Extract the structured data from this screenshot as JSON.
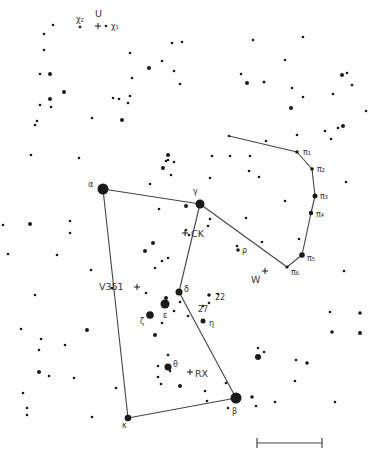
{
  "map": {
    "title": "Orion constellation finder chart",
    "colors": {
      "background": "#ffffff",
      "ink": "#1a1a1a",
      "label": "#333333",
      "line": "#444444"
    },
    "figure_lines": [
      {
        "name": "alpha-gamma",
        "from": [
          103,
          189
        ],
        "to": [
          200,
          204
        ]
      },
      {
        "name": "alpha-kappa",
        "from": [
          103,
          189
        ],
        "to": [
          128,
          418
        ]
      },
      {
        "name": "kappa-beta",
        "from": [
          128,
          418
        ],
        "to": [
          236,
          398
        ]
      },
      {
        "name": "beta-delta",
        "from": [
          236,
          398
        ],
        "to": [
          179,
          292
        ]
      },
      {
        "name": "delta-gamma",
        "from": [
          179,
          292
        ],
        "to": [
          200,
          204
        ]
      },
      {
        "name": "gamma-pi6",
        "from": [
          200,
          204
        ],
        "to": [
          287,
          267
        ]
      },
      {
        "name": "pi6-pi5",
        "from": [
          287,
          267
        ],
        "to": [
          302,
          255
        ]
      },
      {
        "name": "pi5-pi4",
        "from": [
          302,
          255
        ],
        "to": [
          311,
          213
        ]
      },
      {
        "name": "pi4-pi3",
        "from": [
          311,
          213
        ],
        "to": [
          315,
          196
        ]
      },
      {
        "name": "pi3-pi2",
        "from": [
          315,
          196
        ],
        "to": [
          312,
          169
        ]
      },
      {
        "name": "pi2-pi1",
        "from": [
          312,
          169
        ],
        "to": [
          297,
          152
        ]
      },
      {
        "name": "pi1-start",
        "from": [
          297,
          152
        ],
        "to": [
          229,
          136
        ]
      }
    ],
    "named_stars": [
      {
        "id": "alpha",
        "label": "α",
        "x": 103,
        "y": 189,
        "r": 5.5,
        "lx": 88,
        "ly": 187
      },
      {
        "id": "gamma",
        "label": "γ",
        "x": 200,
        "y": 204,
        "r": 4.5,
        "lx": 193,
        "ly": 194
      },
      {
        "id": "delta",
        "label": "δ",
        "x": 179,
        "y": 292,
        "r": 3.5,
        "lx": 184,
        "ly": 292
      },
      {
        "id": "epsilon",
        "label": "ε",
        "x": 165,
        "y": 304,
        "r": 4.5,
        "lx": 163,
        "ly": 318
      },
      {
        "id": "zeta",
        "label": "ζ",
        "x": 150,
        "y": 315,
        "r": 3.8,
        "lx": 140,
        "ly": 324
      },
      {
        "id": "eta",
        "label": "η",
        "x": 203,
        "y": 321,
        "r": 2.5,
        "lx": 209,
        "ly": 326
      },
      {
        "id": "kappa",
        "label": "κ",
        "x": 128,
        "y": 418,
        "r": 3.3,
        "lx": 122,
        "ly": 428
      },
      {
        "id": "beta",
        "label": "β",
        "x": 236,
        "y": 398,
        "r": 5.5,
        "lx": 232,
        "ly": 414
      },
      {
        "id": "theta",
        "label": "θ",
        "x": 168,
        "y": 367,
        "r": 3.5,
        "lx": 173,
        "ly": 367
      },
      {
        "id": "rho",
        "label": "ρ",
        "x": 238,
        "y": 250,
        "r": 1.8,
        "lx": 242,
        "ly": 253
      },
      {
        "id": "pi1",
        "label": "π₁",
        "x": 297,
        "y": 152,
        "r": 1.8,
        "lx": 303,
        "ly": 155
      },
      {
        "id": "pi2",
        "label": "π₂",
        "x": 312,
        "y": 169,
        "r": 1.8,
        "lx": 317,
        "ly": 172
      },
      {
        "id": "pi3",
        "label": "π₃",
        "x": 315,
        "y": 196,
        "r": 2.5,
        "lx": 320,
        "ly": 199
      },
      {
        "id": "pi4",
        "label": "π₄",
        "x": 311,
        "y": 213,
        "r": 2.2,
        "lx": 316,
        "ly": 217
      },
      {
        "id": "pi5",
        "label": "π₅",
        "x": 302,
        "y": 255,
        "r": 2.8,
        "lx": 307,
        "ly": 261
      },
      {
        "id": "pi6",
        "label": "π₆",
        "x": 287,
        "y": 267,
        "r": 1.6,
        "lx": 291,
        "ly": 275
      },
      {
        "id": "chi1",
        "label": "χ₁",
        "x": 106,
        "y": 26,
        "r": 1.3,
        "lx": 111,
        "ly": 29
      },
      {
        "id": "chi2",
        "label": "χ₂",
        "x": 80,
        "y": 27,
        "r": 1.3,
        "lx": 76,
        "ly": 22
      },
      {
        "id": "n22",
        "label": "22",
        "x": 209,
        "y": 295,
        "r": 1.8,
        "lx": 215,
        "ly": 300
      },
      {
        "id": "n27",
        "label": "27",
        "x": 203,
        "y": 306,
        "r": 1.2,
        "lx": 198,
        "ly": 312
      }
    ],
    "variable_stars": [
      {
        "id": "U",
        "label": "U",
        "x": 98,
        "y": 26,
        "lx": 95,
        "ly": 17
      },
      {
        "id": "CK",
        "label": "CK",
        "x": 185,
        "y": 233,
        "lx": 191,
        "ly": 237
      },
      {
        "id": "W",
        "label": "W",
        "x": 265,
        "y": 271,
        "lx": 251,
        "ly": 283
      },
      {
        "id": "V351",
        "label": "V351",
        "x": 137,
        "y": 287,
        "lx": 99,
        "ly": 290
      },
      {
        "id": "RX",
        "label": "RX",
        "x": 190,
        "y": 372,
        "lx": 195,
        "ly": 377
      }
    ],
    "field_stars": [
      [
        53,
        25,
        1.3
      ],
      [
        44,
        34,
        1.3
      ],
      [
        44,
        50,
        1.3
      ],
      [
        40,
        74,
        1.3
      ],
      [
        50,
        74,
        2.0
      ],
      [
        64,
        92,
        2.0
      ],
      [
        50,
        99,
        2.0
      ],
      [
        40,
        105,
        1.3
      ],
      [
        51,
        107,
        1.3
      ],
      [
        37,
        121,
        1.3
      ],
      [
        35,
        125,
        1.3
      ],
      [
        92,
        118,
        1.3
      ],
      [
        122,
        120,
        2.0
      ],
      [
        130,
        53,
        1.3
      ],
      [
        162,
        61,
        1.3
      ],
      [
        149,
        68,
        2.0
      ],
      [
        132,
        78,
        1.3
      ],
      [
        119,
        99,
        1.3
      ],
      [
        113,
        98,
        1.3
      ],
      [
        130,
        96,
        1.3
      ],
      [
        128,
        103,
        1.3
      ],
      [
        182,
        42,
        1.3
      ],
      [
        174,
        71,
        1.3
      ],
      [
        172,
        43,
        1.3
      ],
      [
        180,
        84,
        1.3
      ],
      [
        31,
        155,
        1.3
      ],
      [
        79,
        158,
        1.3
      ],
      [
        168,
        155,
        2.0
      ],
      [
        168,
        160,
        1.3
      ],
      [
        253,
        40,
        1.3
      ],
      [
        303,
        37,
        1.3
      ],
      [
        285,
        60,
        1.3
      ],
      [
        241,
        74,
        1.3
      ],
      [
        247,
        83,
        2.0
      ],
      [
        264,
        82,
        1.5
      ],
      [
        292,
        88,
        1.3
      ],
      [
        303,
        97,
        1.3
      ],
      [
        291,
        108,
        2.0
      ],
      [
        342,
        75,
        2.0
      ],
      [
        347,
        73,
        1.3
      ],
      [
        343,
        126,
        2.0
      ],
      [
        338,
        128,
        1.3
      ],
      [
        325,
        131,
        1.3
      ],
      [
        331,
        139,
        1.3
      ],
      [
        297,
        135,
        1.3
      ],
      [
        250,
        156,
        1.3
      ],
      [
        229,
        136,
        1.3
      ],
      [
        212,
        156,
        1.3
      ],
      [
        166,
        161,
        1.3
      ],
      [
        174,
        162,
        1.3
      ],
      [
        163,
        168,
        2.0
      ],
      [
        171,
        175,
        1.3
      ],
      [
        150,
        184,
        1.3
      ],
      [
        159,
        209,
        1.3
      ],
      [
        186,
        206,
        2.0
      ],
      [
        210,
        178,
        1.3
      ],
      [
        153,
        243,
        2.0
      ],
      [
        168,
        258,
        1.3
      ],
      [
        162,
        261,
        1.3
      ],
      [
        189,
        235,
        1.3
      ],
      [
        210,
        219,
        1.3
      ],
      [
        186,
        230,
        1.3
      ],
      [
        208,
        226,
        1.3
      ],
      [
        145,
        251,
        2.0
      ],
      [
        155,
        268,
        1.3
      ],
      [
        146,
        293,
        1.3
      ],
      [
        166,
        298,
        2.0
      ],
      [
        174,
        311,
        1.3
      ],
      [
        188,
        316,
        1.3
      ],
      [
        209,
        303,
        1.3
      ],
      [
        218,
        294,
        1.3
      ],
      [
        180,
        302,
        1.3
      ],
      [
        155,
        335,
        2.0
      ],
      [
        162,
        323,
        1.3
      ],
      [
        30,
        224,
        2.0
      ],
      [
        70,
        221,
        1.3
      ],
      [
        70,
        233,
        1.3
      ],
      [
        57,
        255,
        1.3
      ],
      [
        91,
        270,
        1.3
      ],
      [
        35,
        295,
        1.3
      ],
      [
        112,
        288,
        1.3
      ],
      [
        21,
        329,
        1.3
      ],
      [
        87,
        330,
        2.0
      ],
      [
        41,
        339,
        1.3
      ],
      [
        39,
        350,
        1.3
      ],
      [
        65,
        345,
        1.3
      ],
      [
        39,
        372,
        2.0
      ],
      [
        49,
        376,
        1.3
      ],
      [
        74,
        378,
        1.3
      ],
      [
        23,
        393,
        1.3
      ],
      [
        27,
        415,
        1.3
      ],
      [
        92,
        417,
        1.3
      ],
      [
        116,
        388,
        1.3
      ],
      [
        27,
        408,
        1.3
      ],
      [
        168,
        355,
        1.3
      ],
      [
        170,
        371,
        1.3
      ],
      [
        158,
        366,
        1.3
      ],
      [
        161,
        384,
        1.3
      ],
      [
        158,
        377,
        1.3
      ],
      [
        180,
        386,
        2.0
      ],
      [
        205,
        391,
        1.3
      ],
      [
        207,
        401,
        1.3
      ],
      [
        226,
        383,
        1.3
      ],
      [
        228,
        408,
        1.3
      ],
      [
        258,
        348,
        1.3
      ],
      [
        264,
        352,
        1.3
      ],
      [
        258,
        357,
        3.0
      ],
      [
        296,
        360,
        1.3
      ],
      [
        307,
        363,
        1.8
      ],
      [
        332,
        332,
        1.8
      ],
      [
        360,
        333,
        2.0
      ],
      [
        295,
        381,
        1.3
      ],
      [
        252,
        397,
        1.8
      ],
      [
        256,
        406,
        1.3
      ],
      [
        275,
        402,
        1.3
      ],
      [
        335,
        402,
        1.3
      ],
      [
        346,
        182,
        1.3
      ],
      [
        344,
        271,
        1.3
      ],
      [
        330,
        312,
        1.3
      ],
      [
        360,
        313,
        1.8
      ],
      [
        299,
        239,
        1.3
      ],
      [
        262,
        242,
        1.3
      ],
      [
        237,
        246,
        1.3
      ],
      [
        246,
        218,
        1.3
      ],
      [
        285,
        201,
        1.3
      ],
      [
        259,
        177,
        1.3
      ],
      [
        230,
        156,
        1.3
      ],
      [
        266,
        141,
        1.3
      ],
      [
        249,
        171,
        1.3
      ],
      [
        333,
        94,
        1.3
      ],
      [
        366,
        111,
        1.3
      ],
      [
        352,
        85,
        1.3
      ],
      [
        3,
        225,
        1.3
      ],
      [
        8,
        254,
        1.3
      ]
    ],
    "scale_bar": {
      "x1": 257,
      "x2": 322,
      "y": 443,
      "tick_h": 5
    }
  }
}
